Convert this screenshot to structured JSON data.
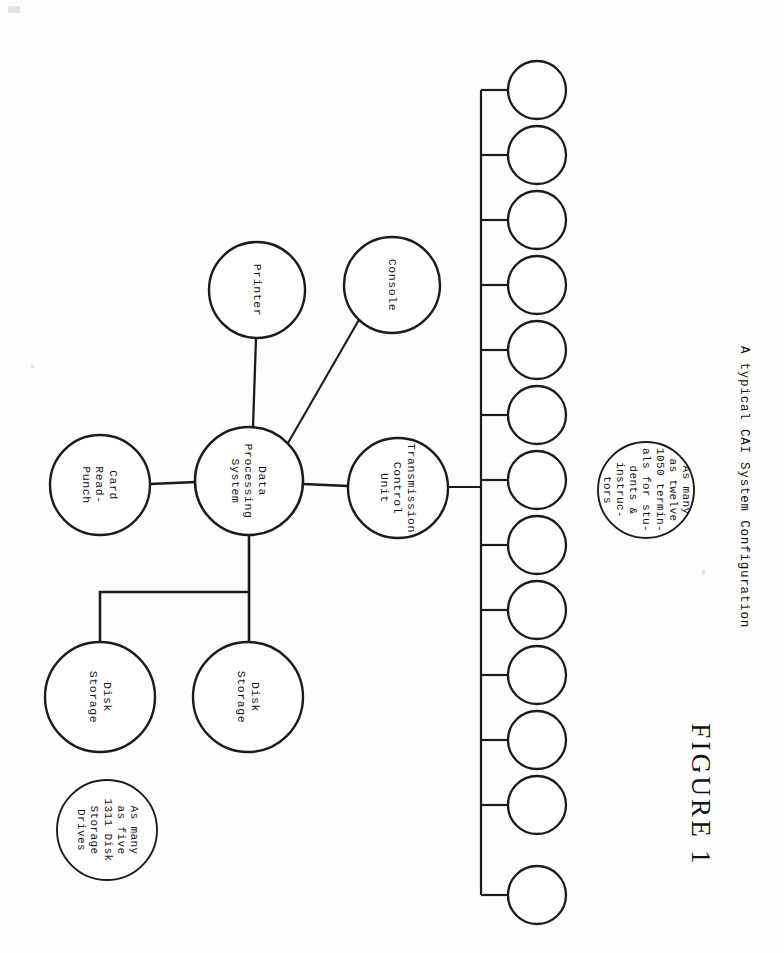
{
  "figure": {
    "number_label": "FIGURE 1",
    "title": "A typical CAI System Configuration"
  },
  "diagram": {
    "type": "node-link block diagram",
    "orientation": "rotated 90 degrees clockwise (landscape scan on portrait page)",
    "stroke_color": "#1b1b1b",
    "background_color": "#fdfdfc",
    "nodes": [
      {
        "id": "printer",
        "label": "Printer",
        "cx": 257,
        "cy": 290,
        "r": 48
      },
      {
        "id": "console",
        "label": "Console",
        "cx": 392,
        "cy": 285,
        "r": 48
      },
      {
        "id": "card-read-punch",
        "label": "Card\nRead-\nPunch",
        "cx": 100,
        "cy": 485,
        "r": 50
      },
      {
        "id": "data-processing-system",
        "label": "Data\nProcessing\nSystem",
        "cx": 249,
        "cy": 481,
        "r": 54
      },
      {
        "id": "transmission-control-unit",
        "label": "Transmission\nControl\nUnit",
        "cx": 398,
        "cy": 488,
        "r": 50
      },
      {
        "id": "disk-storage-1",
        "label": "Disk\nStorage",
        "cx": 100,
        "cy": 697,
        "r": 55
      },
      {
        "id": "disk-storage-2",
        "label": "Disk\nStorage",
        "cx": 248,
        "cy": 697,
        "r": 55
      }
    ],
    "notes": [
      {
        "id": "note-disk-drives",
        "label": "As many\nas five\n1311 Disk\nStorage\nDrives",
        "cx": 107,
        "cy": 830,
        "r": 50
      },
      {
        "id": "note-terminals",
        "label": "As many\nas twelve\n1050 termin-\nals for stu-\ndents &\ninstruc-\ntors",
        "cx": 646,
        "cy": 490,
        "r": 48
      }
    ],
    "terminals": {
      "count": 12,
      "label": "",
      "radius": 29,
      "cx": 537,
      "cy_values": [
        90,
        155,
        220,
        285,
        350,
        415,
        480,
        545,
        610,
        675,
        740,
        805,
        895
      ],
      "bus_x": 481,
      "bus_top": 90,
      "bus_bottom": 895
    },
    "edges": [
      {
        "from": "data-processing-system",
        "to": "printer"
      },
      {
        "from": "data-processing-system",
        "to": "console"
      },
      {
        "from": "card-read-punch",
        "to": "data-processing-system"
      },
      {
        "from": "data-processing-system",
        "to": "transmission-control-unit"
      },
      {
        "from": "data-processing-system",
        "to": "disk-storage-2"
      },
      {
        "from": "data-processing-system",
        "to": "disk-storage-1"
      },
      {
        "from": "transmission-control-unit",
        "to": "terminal-bus"
      }
    ]
  }
}
